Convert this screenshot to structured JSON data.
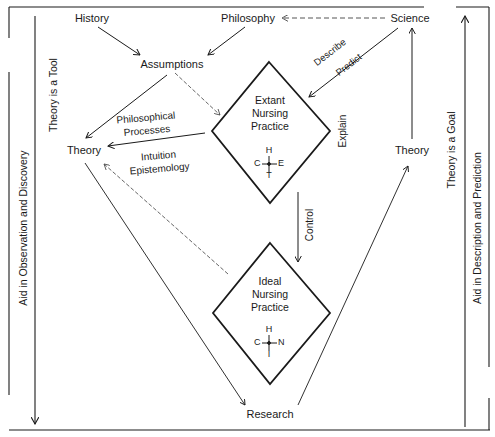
{
  "nodes": {
    "history": "History",
    "philosophy": "Philosophy",
    "science": "Science",
    "assumptions": "Assumptions",
    "theory_left": "Theory",
    "theory_right": "Theory",
    "research": "Research"
  },
  "diamonds": {
    "extant": {
      "title": "Extant\nNursing\nPractice",
      "symbol_top": "H",
      "symbol_left": "C",
      "symbol_right": "E",
      "symbol_bottom": "T"
    },
    "ideal": {
      "title": "Ideal\nNursing\nPractice",
      "symbol_top": "H",
      "symbol_left": "C",
      "symbol_right": "N",
      "symbol_bottom": "I"
    }
  },
  "edge_labels": {
    "describe": "Describe",
    "predict": "Predict",
    "explain": "Explain",
    "control": "Control",
    "philosophical_processes": "Philosophical\nProcesses",
    "intuition_epistemology": "Intuition\nEpistemology"
  },
  "side_labels": {
    "left_inner": "Theory is a Tool",
    "left_outer": "Aid in Observation and Discovery",
    "right_inner": "Theory is a Goal",
    "right_outer": "Aid in Description and Prediction"
  },
  "colors": {
    "line": "#1a1a1a",
    "dashed": "#555555",
    "background": "#ffffff"
  }
}
